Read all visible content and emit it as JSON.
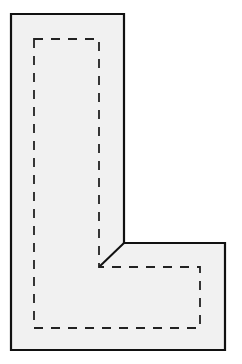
{
  "diagram": {
    "shape": "L-shape",
    "colors": {
      "background": "#ffffff",
      "fill": "#f1f1f1",
      "outline": "#111111",
      "dashed": "#222222"
    },
    "outer_outline_points": "11,14 124,14 124,243 225,243 225,350 11,350",
    "diagonal_points": "124,243 99,267",
    "dashed_outline_points": "34,39 99,39 99,267 200,267 200,328 34,328"
  }
}
